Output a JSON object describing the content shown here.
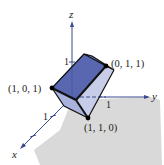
{
  "diagram": {
    "type": "3d-cube-on-plane",
    "axes": {
      "x": {
        "label": "x",
        "tick": "1"
      },
      "y": {
        "label": "y",
        "tick": "1"
      },
      "z": {
        "label": "z",
        "tick": "1"
      }
    },
    "points": [
      {
        "label": "(1, 0, 1)"
      },
      {
        "label": "(0, 1, 1)"
      },
      {
        "label": "(1, 1, 0)"
      }
    ],
    "colors": {
      "axis": "#3b4a8c",
      "face_dark": "#4a5aa8",
      "face_mid": "#7f8fcf",
      "face_light": "#c7cde8",
      "floor": "#d9d9d9",
      "edge": "#111111"
    }
  }
}
